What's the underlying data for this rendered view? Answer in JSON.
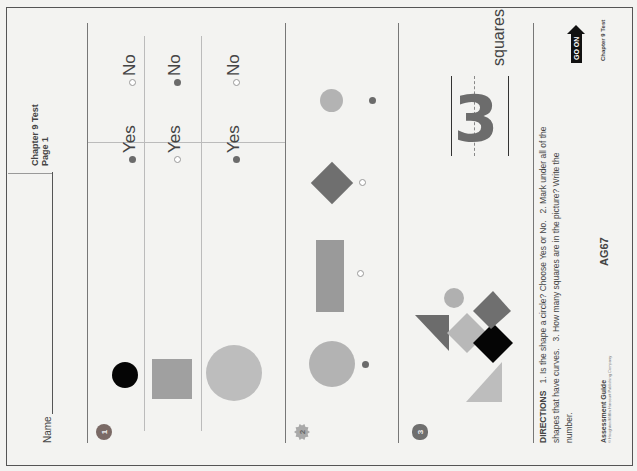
{
  "header": {
    "name_label": "Name",
    "chapter_title": "Chapter 9 Test",
    "page_label": "Page 1"
  },
  "questions": [
    {
      "number": "1",
      "icon": "apple-icon",
      "rows": [
        {
          "shape": "black-circle",
          "yes_label": "Yes",
          "no_label": "No",
          "yes_selected": true,
          "no_selected": false
        },
        {
          "shape": "gray-square",
          "yes_label": "Yes",
          "no_label": "No",
          "yes_selected": false,
          "no_selected": true
        },
        {
          "shape": "large-gray-circle",
          "yes_label": "Yes",
          "no_label": "No",
          "yes_selected": true,
          "no_selected": false
        }
      ]
    },
    {
      "number": "2",
      "icon": "sun-badge-icon",
      "items": [
        {
          "shape": "large-gray-circle",
          "marked": true
        },
        {
          "shape": "gray-rectangle",
          "marked": false
        },
        {
          "shape": "dark-diamond",
          "marked": false
        },
        {
          "shape": "small-gray-circle",
          "marked": true
        }
      ]
    },
    {
      "number": "3",
      "icon": "flower-badge-icon",
      "answer": "3",
      "units": "squares"
    }
  ],
  "directions": {
    "heading": "DIRECTIONS",
    "text_1": "1.  Is the shape a circle? Choose Yes or No.",
    "text_2": "2.  Mark under all of the shapes that have curves.",
    "text_3": "3.  How many squares are in the picture? Write the number."
  },
  "footer": {
    "guide": "Assessment Guide",
    "copyright": "© Houghton Mifflin Harcourt Publishing Company",
    "page_code": "AG67",
    "go_on": "GO ON",
    "chapter": "Chapter 9 Test"
  },
  "colors": {
    "ink": "#444444",
    "filled_bubble": "#6b6b6b",
    "dark_gray": "#6f6f6f",
    "mid_gray": "#9a9a9a",
    "light_gray": "#bdbdbd",
    "black": "#050505"
  }
}
